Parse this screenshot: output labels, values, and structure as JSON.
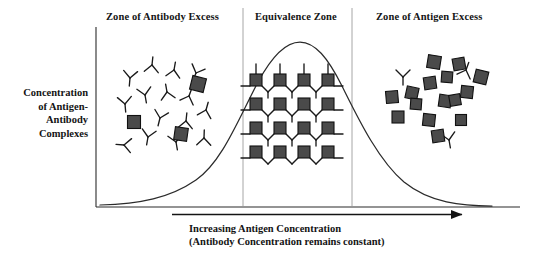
{
  "figure": {
    "background": "#ffffff",
    "ink": "#141414",
    "antigen_fill": "#4a4a4a",
    "antigen_stroke": "#111111",
    "antibody_stroke": "#1a1a1a",
    "divider_color": "#9a9a9a",
    "curve_color": "#2b2b2b"
  },
  "zones": [
    {
      "id": "antibody-excess",
      "label": "Zone of Antibody Excess"
    },
    {
      "id": "equivalence",
      "label": "Equivalence Zone"
    },
    {
      "id": "antigen-excess",
      "label": "Zone of Antigen Excess"
    }
  ],
  "y_axis": {
    "lines": [
      "Concentration",
      "of Antigen-",
      "Antibody",
      "Complexes"
    ]
  },
  "x_axis": {
    "lines": [
      "Increasing Antigen Concentration",
      "(Antibody Concentration remains constant)"
    ],
    "arrow": "right-arrow"
  },
  "chart_data": {
    "type": "line",
    "xlabel": "Increasing Antigen Concentration (Antibody Concentration remains constant)",
    "ylabel": "Concentration of Antigen-Antibody Complexes",
    "grid": false,
    "legend": false,
    "xlim": [
      0,
      100
    ],
    "ylim": [
      0,
      100
    ],
    "annotations": [
      {
        "text": "Zone of Antibody Excess",
        "x": 18,
        "region": [
          0,
          36
        ]
      },
      {
        "text": "Equivalence Zone",
        "x": 50,
        "region": [
          36,
          62
        ]
      },
      {
        "text": "Zone of Antigen Excess",
        "x": 82,
        "region": [
          62,
          100
        ]
      }
    ],
    "series": [
      {
        "name": "Antigen-Antibody Complexes",
        "x": [
          0,
          5,
          10,
          15,
          20,
          25,
          30,
          35,
          40,
          45,
          50,
          55,
          60,
          65,
          70,
          75,
          80,
          85,
          90,
          95,
          100
        ],
        "y": [
          2,
          3,
          4,
          6,
          9,
          14,
          22,
          35,
          54,
          74,
          89,
          95,
          92,
          82,
          66,
          49,
          33,
          21,
          12,
          6,
          3
        ]
      }
    ]
  },
  "particles": {
    "antibody_excess": {
      "antibodies": [
        {
          "x": 130,
          "y": 78,
          "r": 5
        },
        {
          "x": 152,
          "y": 65,
          "r": 186
        },
        {
          "x": 174,
          "y": 70,
          "r": 190
        },
        {
          "x": 196,
          "y": 73,
          "r": 22
        },
        {
          "x": 145,
          "y": 95,
          "r": 350
        },
        {
          "x": 167,
          "y": 92,
          "r": 170
        },
        {
          "x": 189,
          "y": 96,
          "r": 200
        },
        {
          "x": 125,
          "y": 104,
          "r": 355
        },
        {
          "x": 160,
          "y": 118,
          "r": 14
        },
        {
          "x": 186,
          "y": 121,
          "r": 186
        },
        {
          "x": 206,
          "y": 110,
          "r": 196
        },
        {
          "x": 148,
          "y": 137,
          "r": 10
        },
        {
          "x": 176,
          "y": 142,
          "r": 350
        },
        {
          "x": 124,
          "y": 145,
          "r": 95
        },
        {
          "x": 204,
          "y": 138,
          "r": 182
        }
      ],
      "antigens": [
        {
          "x": 134,
          "y": 122,
          "s": 13,
          "r": 0
        },
        {
          "x": 198,
          "y": 84,
          "s": 14,
          "r": 14
        },
        {
          "x": 181,
          "y": 134,
          "s": 13,
          "r": 8
        }
      ]
    },
    "equivalence": {
      "lattice_rows": 4,
      "lattice_cols": 4,
      "origin": {
        "x": 256,
        "y": 80
      },
      "spacing": {
        "x": 24,
        "y": 24
      },
      "antigen_size": 12
    },
    "antigen_excess": {
      "antibodies": [
        {
          "x": 403,
          "y": 77,
          "r": 0
        },
        {
          "x": 466,
          "y": 70,
          "r": 200
        },
        {
          "x": 449,
          "y": 140,
          "r": 350
        }
      ],
      "antigens": [
        {
          "x": 434,
          "y": 62,
          "s": 13,
          "r": 9
        },
        {
          "x": 459,
          "y": 64,
          "s": 12,
          "r": 350
        },
        {
          "x": 481,
          "y": 77,
          "s": 13,
          "r": 14
        },
        {
          "x": 447,
          "y": 77,
          "s": 11,
          "r": 4
        },
        {
          "x": 467,
          "y": 92,
          "s": 12,
          "r": 6
        },
        {
          "x": 430,
          "y": 83,
          "s": 12,
          "r": 352
        },
        {
          "x": 412,
          "y": 93,
          "s": 12,
          "r": 12
        },
        {
          "x": 392,
          "y": 97,
          "s": 12,
          "r": 355
        },
        {
          "x": 445,
          "y": 101,
          "s": 12,
          "r": 8
        },
        {
          "x": 455,
          "y": 100,
          "s": 11,
          "r": 350
        },
        {
          "x": 398,
          "y": 117,
          "s": 12,
          "r": 0
        },
        {
          "x": 429,
          "y": 120,
          "s": 12,
          "r": 6
        },
        {
          "x": 461,
          "y": 120,
          "s": 11,
          "r": 0
        },
        {
          "x": 438,
          "y": 136,
          "s": 12,
          "r": 352
        },
        {
          "x": 416,
          "y": 104,
          "s": 11,
          "r": 4
        }
      ]
    }
  }
}
